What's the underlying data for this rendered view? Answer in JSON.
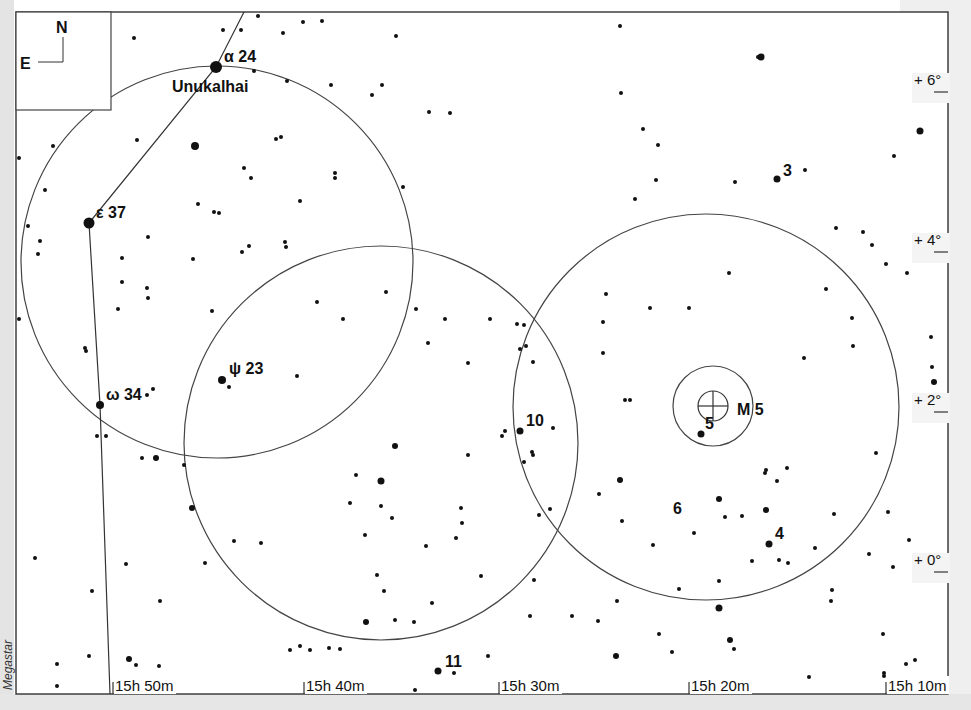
{
  "compass": {
    "north": "N",
    "east": "E"
  },
  "credit": "Megastar",
  "named_star": {
    "name": "Unukalhai",
    "greek": "α",
    "flamsteed": "24"
  },
  "constellation_labels": [
    {
      "id": "alpha",
      "greek": "α",
      "num": "24",
      "x": 216,
      "y": 67,
      "lx": 224,
      "ly": 62
    },
    {
      "id": "epsilon",
      "greek": "ε",
      "num": "37",
      "x": 89,
      "y": 223,
      "lx": 96,
      "ly": 218
    },
    {
      "id": "omega",
      "greek": "ω",
      "num": "34",
      "x": 100,
      "y": 405,
      "lx": 106,
      "ly": 400
    },
    {
      "id": "psi",
      "greek": "ψ",
      "num": "23",
      "x": 222,
      "y": 380,
      "lx": 229,
      "ly": 374
    }
  ],
  "numbered_labels": [
    {
      "text": "3",
      "x": 783,
      "y": 176
    },
    {
      "text": "10",
      "x": 526,
      "y": 426
    },
    {
      "text": "5",
      "x": 705,
      "y": 429
    },
    {
      "text": "6",
      "x": 673,
      "y": 514
    },
    {
      "text": "4",
      "x": 775,
      "y": 539
    },
    {
      "text": "11",
      "x": 445,
      "y": 667
    }
  ],
  "cluster": {
    "name": "M 5",
    "x": 713,
    "y": 406,
    "inner_r": 15,
    "outer_r": 40
  },
  "fov_circles": [
    {
      "cx": 217,
      "cy": 262,
      "r": 196
    },
    {
      "cx": 381,
      "cy": 443,
      "r": 197
    },
    {
      "cx": 706,
      "cy": 407,
      "r": 193
    }
  ],
  "ra_axis": {
    "labels": [
      "15h 50m",
      "15h 40m",
      "15h 30m",
      "15h 20m",
      "15h 10m"
    ],
    "x": [
      113,
      304,
      499,
      689,
      886
    ]
  },
  "dec_axis": {
    "labels": [
      "+ 6°",
      "+ 4°",
      "+ 2°",
      "0°"
    ],
    "display": [
      "+ 6°",
      "+ 4°",
      "+ 2°",
      "+ 0°"
    ],
    "y": [
      83,
      243,
      403,
      563
    ]
  },
  "chart_data": {
    "type": "scatter",
    "xlabel": "Right Ascension",
    "ylabel": "Declination",
    "x_ticks": [
      "15h 50m",
      "15h 40m",
      "15h 30m",
      "15h 20m",
      "15h 10m"
    ],
    "y_ticks": [
      "+6°",
      "+4°",
      "+2°",
      "+0°"
    ],
    "annotations": [
      "Unukalhai",
      "α 24",
      "ε 37",
      "ω 34",
      "ψ 23",
      "M 5",
      "3",
      "4",
      "5",
      "6",
      "10",
      "11"
    ],
    "series": [
      {
        "name": "bright_stars",
        "points": [
          [
            216,
            67,
            6
          ],
          [
            89,
            223,
            5.5
          ],
          [
            195,
            146,
            4
          ],
          [
            100,
            405,
            4
          ],
          [
            222,
            380,
            4
          ],
          [
            520,
            431,
            3.5
          ],
          [
            701,
            434,
            3.5
          ],
          [
            777,
            179,
            3.5
          ],
          [
            769,
            544,
            3.5
          ],
          [
            438,
            671,
            3.5
          ],
          [
            761,
            57,
            3.5
          ],
          [
            920,
            131,
            3.5
          ],
          [
            934,
            382,
            3
          ],
          [
            381,
            481,
            3.5
          ],
          [
            395,
            446,
            3
          ],
          [
            192,
            508,
            3
          ],
          [
            366,
            622,
            3
          ],
          [
            156,
            458,
            3
          ],
          [
            719,
            499,
            3
          ],
          [
            766,
            510,
            3
          ],
          [
            719,
            608,
            3.5
          ],
          [
            616,
            656,
            3
          ],
          [
            129,
            659,
            3
          ],
          [
            137,
            140,
            2
          ],
          [
            620,
            480,
            3
          ],
          [
            730,
            640,
            3
          ]
        ]
      },
      {
        "name": "faint_stars",
        "points": [
          [
            134,
            38,
            2
          ],
          [
            258,
            16,
            2
          ],
          [
            303,
            22,
            2
          ],
          [
            322,
            21,
            2
          ],
          [
            396,
            36,
            2
          ],
          [
            283,
            33,
            2
          ],
          [
            241,
            30,
            2
          ],
          [
            223,
            30,
            2
          ],
          [
            287,
            81,
            2
          ],
          [
            331,
            85,
            2
          ],
          [
            372,
            95,
            2
          ],
          [
            382,
            85,
            2
          ],
          [
            429,
            112,
            2
          ],
          [
            450,
            113,
            2
          ],
          [
            254,
            71,
            2
          ],
          [
            276,
            139,
            2
          ],
          [
            281,
            137,
            2
          ],
          [
            244,
            168,
            2
          ],
          [
            251,
            178,
            2
          ],
          [
            335,
            173,
            2
          ],
          [
            335,
            178,
            2
          ],
          [
            300,
            201,
            2
          ],
          [
            403,
            187,
            2
          ],
          [
            19,
            158,
            2
          ],
          [
            53,
            146,
            2
          ],
          [
            45,
            190,
            2
          ],
          [
            28,
            226,
            2
          ],
          [
            40,
            241,
            2
          ],
          [
            38,
            254,
            2
          ],
          [
            198,
            204,
            2
          ],
          [
            219,
            213,
            2
          ],
          [
            214,
            212,
            2
          ],
          [
            148,
            237,
            2
          ],
          [
            122,
            258,
            2
          ],
          [
            193,
            259,
            2
          ],
          [
            242,
            252,
            2
          ],
          [
            286,
            247,
            2
          ],
          [
            122,
            282,
            2
          ],
          [
            147,
            288,
            2
          ],
          [
            148,
            298,
            2
          ],
          [
            118,
            309,
            2
          ],
          [
            212,
            311,
            2
          ],
          [
            19,
            319,
            2
          ],
          [
            86,
            351,
            2
          ],
          [
            85,
            348,
            2
          ],
          [
            153,
            389,
            2
          ],
          [
            147,
            395,
            2
          ],
          [
            106,
            436,
            2
          ],
          [
            97,
            436,
            2
          ],
          [
            142,
            458,
            2
          ],
          [
            184,
            465,
            2
          ],
          [
            229,
            387,
            2
          ],
          [
            297,
            376,
            2
          ],
          [
            249,
            246,
            2
          ],
          [
            285,
            242,
            2
          ],
          [
            317,
            302,
            2
          ],
          [
            343,
            319,
            2
          ],
          [
            416,
            309,
            2
          ],
          [
            445,
            319,
            2
          ],
          [
            386,
            292,
            2
          ],
          [
            428,
            343,
            2
          ],
          [
            468,
            363,
            2
          ],
          [
            490,
            319,
            2
          ],
          [
            524,
            325,
            2
          ],
          [
            526,
            346,
            2
          ],
          [
            468,
            455,
            2
          ],
          [
            356,
            475,
            2
          ],
          [
            381,
            506,
            2
          ],
          [
            392,
            518,
            2
          ],
          [
            350,
            503,
            2
          ],
          [
            365,
            535,
            2
          ],
          [
            461,
            508,
            2
          ],
          [
            426,
            546,
            2
          ],
          [
            456,
            538,
            2
          ],
          [
            481,
            576,
            2
          ],
          [
            432,
            603,
            2
          ],
          [
            462,
            523,
            2
          ],
          [
            414,
            622,
            2
          ],
          [
            395,
            620,
            2
          ],
          [
            35,
            558,
            2
          ],
          [
            126,
            564,
            2
          ],
          [
            92,
            591,
            2
          ],
          [
            160,
            601,
            2
          ],
          [
            234,
            541,
            2
          ],
          [
            261,
            543,
            2
          ],
          [
            205,
            563,
            2
          ],
          [
            300,
            646,
            2
          ],
          [
            415,
            690,
            2
          ],
          [
            57,
            664,
            2
          ],
          [
            89,
            656,
            2
          ],
          [
            57,
            686,
            2
          ],
          [
            136,
            665,
            2
          ],
          [
            159,
            666,
            2
          ],
          [
            290,
            650,
            2
          ],
          [
            310,
            650,
            2
          ],
          [
            329,
            648,
            2
          ],
          [
            340,
            649,
            2
          ],
          [
            377,
            575,
            2
          ],
          [
            384,
            591,
            2
          ],
          [
            454,
            673,
            2
          ],
          [
            488,
            656,
            2
          ],
          [
            530,
            616,
            2
          ],
          [
            572,
            616,
            2
          ],
          [
            598,
            621,
            2
          ],
          [
            659,
            634,
            2
          ],
          [
            672,
            652,
            2
          ],
          [
            719,
            581,
            2
          ],
          [
            734,
            649,
            2
          ],
          [
            809,
            677,
            2
          ],
          [
            884,
            673,
            2
          ],
          [
            906,
            664,
            2
          ],
          [
            915,
            660,
            2
          ],
          [
            883,
            634,
            2
          ],
          [
            884,
            676,
            2
          ],
          [
            831,
            601,
            2
          ],
          [
            893,
            567,
            2
          ],
          [
            888,
            512,
            2
          ],
          [
            909,
            540,
            2
          ],
          [
            928,
            577,
            2
          ],
          [
            620,
            26,
            2
          ],
          [
            758,
            57,
            2
          ],
          [
            621,
            93,
            2
          ],
          [
            643,
            129,
            2
          ],
          [
            658,
            145,
            2
          ],
          [
            656,
            180,
            2
          ],
          [
            735,
            182,
            2
          ],
          [
            805,
            170,
            2
          ],
          [
            894,
            156,
            2
          ],
          [
            635,
            199,
            2
          ],
          [
            836,
            228,
            2
          ],
          [
            872,
            245,
            2
          ],
          [
            886,
            264,
            2
          ],
          [
            917,
            249,
            2
          ],
          [
            863,
            232,
            2
          ],
          [
            907,
            273,
            2
          ],
          [
            931,
            337,
            2
          ],
          [
            932,
            367,
            2
          ],
          [
            606,
            294,
            2
          ],
          [
            650,
            308,
            2
          ],
          [
            689,
            308,
            2
          ],
          [
            729,
            273,
            2
          ],
          [
            826,
            289,
            2
          ],
          [
            852,
            318,
            2
          ],
          [
            853,
            346,
            2
          ],
          [
            804,
            358,
            2
          ],
          [
            533,
            362,
            2
          ],
          [
            520,
            349,
            2
          ],
          [
            517,
            324,
            2
          ],
          [
            603,
            322,
            2
          ],
          [
            603,
            353,
            2
          ],
          [
            630,
            400,
            2
          ],
          [
            625,
            400,
            2
          ],
          [
            766,
            470,
            2
          ],
          [
            742,
            516,
            2
          ],
          [
            765,
            473,
            2
          ],
          [
            777,
            481,
            2
          ],
          [
            787,
            468,
            2
          ],
          [
            725,
            517,
            2
          ],
          [
            779,
            560,
            2
          ],
          [
            788,
            563,
            2
          ],
          [
            815,
            548,
            2
          ],
          [
            752,
            561,
            2
          ],
          [
            599,
            494,
            2
          ],
          [
            653,
            545,
            2
          ],
          [
            694,
            533,
            2
          ],
          [
            622,
            521,
            2
          ],
          [
            617,
            601,
            2
          ],
          [
            679,
            589,
            2
          ],
          [
            832,
            590,
            2
          ],
          [
            834,
            514,
            2
          ],
          [
            869,
            554,
            2
          ],
          [
            876,
            453,
            2
          ],
          [
            923,
            415,
            2
          ],
          [
            533,
            455,
            2
          ],
          [
            532,
            452,
            2
          ],
          [
            502,
            436,
            2
          ],
          [
            505,
            431,
            2
          ],
          [
            553,
            428,
            2
          ],
          [
            550,
            509,
            2
          ],
          [
            524,
            462,
            2
          ],
          [
            539,
            515,
            2
          ],
          [
            534,
            580,
            2
          ]
        ]
      }
    ]
  }
}
